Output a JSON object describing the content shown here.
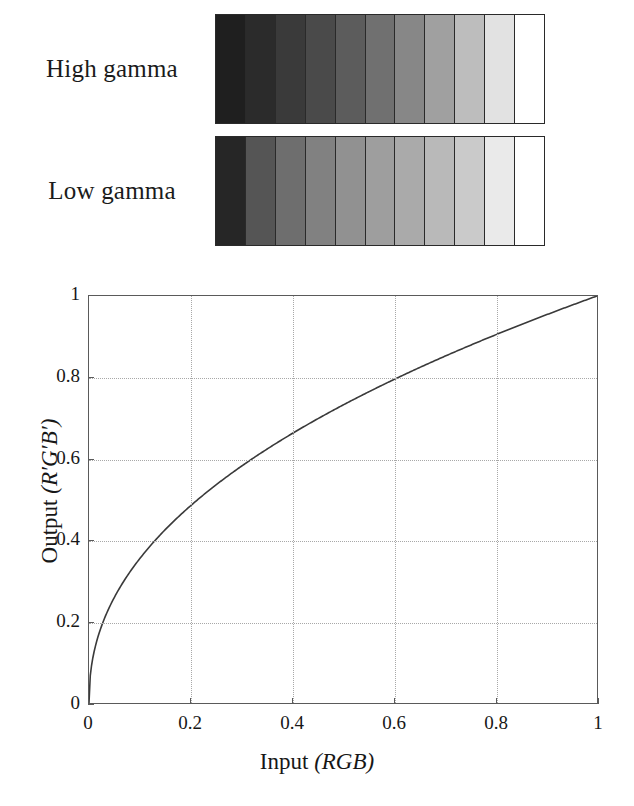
{
  "figure": {
    "strips": [
      {
        "name": "high-gamma",
        "label": "High gamma",
        "patch_count": 11,
        "patches": [
          "#1f1f1f",
          "#2b2b2b",
          "#3a3a3a",
          "#4a4a4a",
          "#5c5c5c",
          "#707070",
          "#878787",
          "#a0a0a0",
          "#bdbdbd",
          "#e2e2e2",
          "#ffffff"
        ]
      },
      {
        "name": "low-gamma",
        "label": "Low gamma",
        "patch_count": 11,
        "patches": [
          "#262626",
          "#555555",
          "#6e6e6e",
          "#818181",
          "#919191",
          "#9e9e9e",
          "#aaaaaa",
          "#b9b9b9",
          "#cacaca",
          "#eaeaea",
          "#ffffff"
        ]
      }
    ],
    "border_color": "#2a2a2a"
  },
  "chart_data": {
    "type": "line",
    "title": "",
    "xlabel": "Input (RGB)",
    "xlabel_plain": "Input",
    "xlabel_italic": "(RGB)",
    "ylabel": "Output (R′G′B′)",
    "ylabel_plain": "Output",
    "ylabel_italic": "(R′G′B′)",
    "xlim": [
      0,
      1
    ],
    "ylim": [
      0,
      1
    ],
    "grid": true,
    "grid_style": "dotted",
    "grid_color": "#a8a8a8",
    "legend": "none",
    "line_color": "#3a3a3a",
    "xticks": [
      "0",
      "0.2",
      "0.4",
      "0.6",
      "0.8",
      "1"
    ],
    "xtick_values": [
      0,
      0.2,
      0.4,
      0.6,
      0.8,
      1
    ],
    "yticks": [
      "0",
      "0.2",
      "0.4",
      "0.6",
      "0.8",
      "1"
    ],
    "ytick_values": [
      0,
      0.2,
      0.4,
      0.6,
      0.8,
      1
    ],
    "series": [
      {
        "name": "gamma transfer curve",
        "exponent": 0.45,
        "x": [
          0,
          0.01,
          0.02,
          0.03,
          0.04,
          0.05,
          0.06,
          0.08,
          0.1,
          0.12,
          0.15,
          0.18,
          0.2,
          0.25,
          0.3,
          0.35,
          0.4,
          0.45,
          0.5,
          0.55,
          0.6,
          0.65,
          0.7,
          0.75,
          0.8,
          0.85,
          0.9,
          0.95,
          1
        ],
        "y": [
          0,
          0.126,
          0.172,
          0.207,
          0.235,
          0.26,
          0.282,
          0.32,
          0.355,
          0.385,
          0.425,
          0.461,
          0.483,
          0.533,
          0.577,
          0.617,
          0.654,
          0.689,
          0.721,
          0.752,
          0.781,
          0.809,
          0.836,
          0.862,
          0.887,
          0.911,
          0.934,
          0.957,
          1
        ]
      }
    ]
  }
}
